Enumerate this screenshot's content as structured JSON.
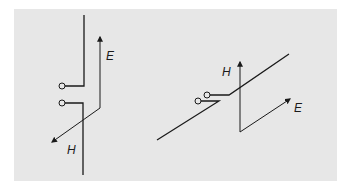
{
  "figure": {
    "background_color": "#e7e7e7",
    "line_color": "#1a1a1a",
    "left_diagram": {
      "e_label": "E",
      "h_label": "H",
      "description": "Vertical dipole antenna fed at center; E field vertical, H field diagonal"
    },
    "right_diagram": {
      "e_label": "E",
      "h_label": "H",
      "description": "Inclined dipole antenna fed at center; H field vertical, E field diagonal"
    }
  }
}
